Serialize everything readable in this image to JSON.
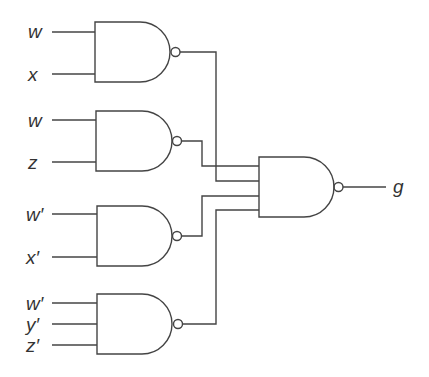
{
  "diagram": {
    "type": "logic-circuit",
    "stroke_color": "#444444",
    "inputs": [
      {
        "label": "w",
        "x": 28,
        "y": 22
      },
      {
        "label": "x",
        "x": 28,
        "y": 65
      },
      {
        "label": "w",
        "x": 28,
        "y": 111
      },
      {
        "label": "z",
        "x": 28,
        "y": 153
      },
      {
        "label": "w′",
        "x": 26,
        "y": 205
      },
      {
        "label": "x′",
        "x": 26,
        "y": 248
      },
      {
        "label": "w′",
        "x": 26,
        "y": 294
      },
      {
        "label": "y′",
        "x": 26,
        "y": 315
      },
      {
        "label": "z′",
        "x": 26,
        "y": 336
      }
    ],
    "gates": [
      {
        "name": "nand-1",
        "type": "NAND",
        "inputs": [
          "w",
          "x"
        ]
      },
      {
        "name": "nand-2",
        "type": "NAND",
        "inputs": [
          "w",
          "z"
        ]
      },
      {
        "name": "nand-3",
        "type": "NAND",
        "inputs": [
          "w′",
          "x′"
        ]
      },
      {
        "name": "nand-4",
        "type": "NAND",
        "inputs": [
          "w′",
          "y′",
          "z′"
        ]
      },
      {
        "name": "nand-out",
        "type": "NAND",
        "inputs": [
          "nand-1",
          "nand-2",
          "nand-3",
          "nand-4"
        ]
      }
    ],
    "output": {
      "label": "g",
      "x": 393,
      "y": 177
    }
  }
}
